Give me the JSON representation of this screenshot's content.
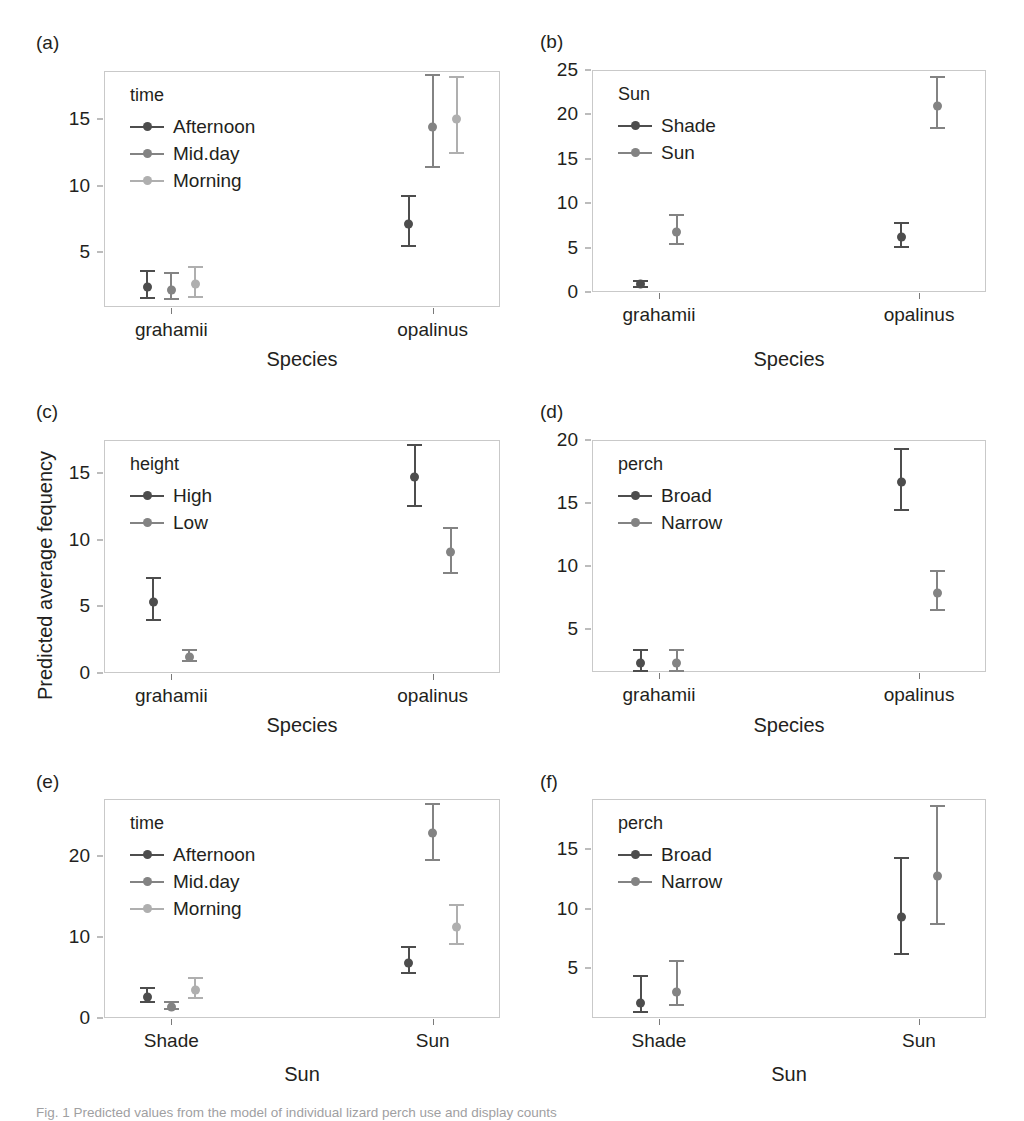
{
  "figure": {
    "y_axis_label": "Predicted average fequency",
    "caption": "Fig. 1 Predicted values from the model of individual lizard perch use and display counts"
  },
  "series_colors": {
    "dark": "#4d4d4d",
    "medium": "#838383",
    "light": "#afafaf"
  },
  "chart_data": [
    {
      "id": "a",
      "tag": "(a)",
      "type": "scatter",
      "title": "",
      "xlabel": "Species",
      "ylabel": "Predicted average fequency",
      "categories": [
        "grahamii",
        "opalinus"
      ],
      "ylim": [
        0.9,
        18.6
      ],
      "yticks": [
        5,
        10,
        15
      ],
      "grid": false,
      "legend_title": "time",
      "legend_position": "top-left-inside",
      "series": [
        {
          "name": "Afternoon",
          "color": "dark",
          "values": [
            2.4,
            7.1
          ],
          "lower": [
            1.5,
            5.4
          ],
          "upper": [
            3.7,
            9.3
          ]
        },
        {
          "name": "Mid.day",
          "color": "medium",
          "values": [
            2.2,
            14.4
          ],
          "lower": [
            1.4,
            11.3
          ],
          "upper": [
            3.5,
            18.4
          ]
        },
        {
          "name": "Morning",
          "color": "light",
          "values": [
            2.6,
            15.0
          ],
          "lower": [
            1.6,
            12.4
          ],
          "upper": [
            4.0,
            18.2
          ]
        }
      ]
    },
    {
      "id": "b",
      "tag": "(b)",
      "type": "scatter",
      "title": "",
      "xlabel": "Species",
      "ylabel": "Predicted average fequency",
      "categories": [
        "grahamii",
        "opalinus"
      ],
      "ylim": [
        0,
        25
      ],
      "yticks": [
        0,
        5,
        10,
        15,
        20,
        25
      ],
      "grid": false,
      "legend_title": "Sun",
      "legend_position": "top-left-inside",
      "series": [
        {
          "name": "Shade",
          "color": "dark",
          "values": [
            0.9,
            6.2
          ],
          "lower": [
            0.5,
            4.9
          ],
          "upper": [
            1.3,
            7.9
          ]
        },
        {
          "name": "Sun",
          "color": "medium",
          "values": [
            6.8,
            21.0
          ],
          "lower": [
            5.3,
            18.4
          ],
          "upper": [
            8.8,
            24.3
          ]
        }
      ]
    },
    {
      "id": "c",
      "tag": "(c)",
      "type": "scatter",
      "title": "",
      "xlabel": "Species",
      "ylabel": "Predicted average fequency",
      "categories": [
        "grahamii",
        "opalinus"
      ],
      "ylim": [
        0,
        17.5
      ],
      "yticks": [
        0,
        5,
        10,
        15
      ],
      "grid": false,
      "legend_title": "height",
      "legend_position": "top-left-inside",
      "series": [
        {
          "name": "High",
          "color": "dark",
          "values": [
            5.3,
            14.7
          ],
          "lower": [
            3.9,
            12.5
          ],
          "upper": [
            7.2,
            17.2
          ]
        },
        {
          "name": "Low",
          "color": "medium",
          "values": [
            1.2,
            9.1
          ],
          "lower": [
            0.8,
            7.4
          ],
          "upper": [
            1.8,
            11.0
          ]
        }
      ]
    },
    {
      "id": "d",
      "tag": "(d)",
      "type": "scatter",
      "title": "",
      "xlabel": "Species",
      "ylabel": "Predicted average fequency",
      "categories": [
        "grahamii",
        "opalinus"
      ],
      "ylim": [
        1.6,
        20
      ],
      "yticks": [
        5,
        10,
        15,
        20
      ],
      "grid": false,
      "legend_title": "perch",
      "legend_position": "top-left-inside",
      "series": [
        {
          "name": "Broad",
          "color": "dark",
          "values": [
            2.3,
            16.7
          ],
          "lower": [
            1.6,
            14.4
          ],
          "upper": [
            3.4,
            19.4
          ]
        },
        {
          "name": "Narrow",
          "color": "medium",
          "values": [
            2.3,
            7.9
          ],
          "lower": [
            1.6,
            6.4
          ],
          "upper": [
            3.4,
            9.7
          ]
        }
      ]
    },
    {
      "id": "e",
      "tag": "(e)",
      "type": "scatter",
      "title": "",
      "xlabel": "Sun",
      "ylabel": "Predicted average fequency",
      "categories": [
        "Shade",
        "Sun"
      ],
      "ylim": [
        0,
        27
      ],
      "yticks": [
        0,
        10,
        20
      ],
      "grid": false,
      "legend_title": "time",
      "legend_position": "top-left-inside",
      "series": [
        {
          "name": "Afternoon",
          "color": "dark",
          "values": [
            2.6,
            6.8
          ],
          "lower": [
            1.9,
            5.4
          ],
          "upper": [
            3.8,
            8.9
          ]
        },
        {
          "name": "Mid.day",
          "color": "medium",
          "values": [
            1.4,
            22.8
          ],
          "lower": [
            1.0,
            19.4
          ],
          "upper": [
            2.1,
            26.5
          ]
        },
        {
          "name": "Morning",
          "color": "light",
          "values": [
            3.5,
            11.2
          ],
          "lower": [
            2.4,
            9.0
          ],
          "upper": [
            5.0,
            14.0
          ]
        }
      ]
    },
    {
      "id": "f",
      "tag": "(f)",
      "type": "scatter",
      "title": "",
      "xlabel": "Sun",
      "ylabel": "Predicted average fequency",
      "categories": [
        "Shade",
        "Sun"
      ],
      "ylim": [
        0.8,
        19.2
      ],
      "yticks": [
        5,
        10,
        15
      ],
      "grid": false,
      "legend_title": "perch",
      "legend_position": "top-left-inside",
      "series": [
        {
          "name": "Broad",
          "color": "dark",
          "values": [
            2.1,
            9.3
          ],
          "lower": [
            1.2,
            6.1
          ],
          "upper": [
            4.4,
            14.3
          ]
        },
        {
          "name": "Narrow",
          "color": "medium",
          "values": [
            3.0,
            12.7
          ],
          "lower": [
            1.8,
            8.6
          ],
          "upper": [
            5.7,
            18.7
          ]
        }
      ]
    }
  ]
}
